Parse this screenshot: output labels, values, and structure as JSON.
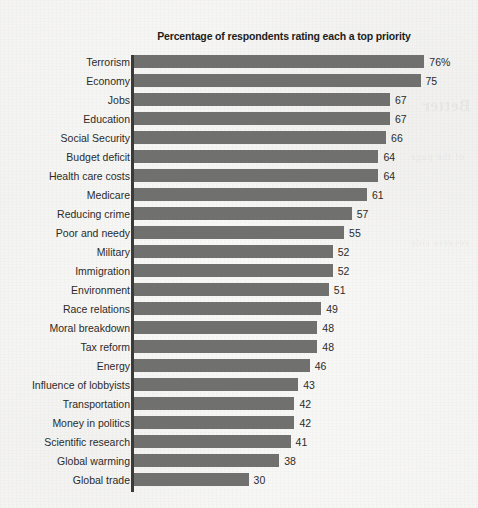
{
  "chart_data": {
    "type": "bar",
    "orientation": "horizontal",
    "title": "Percentage of respondents rating each a top priority",
    "xlabel": "",
    "ylabel": "",
    "xlim": [
      0,
      76
    ],
    "grid": false,
    "legend": false,
    "value_suffix_first": "%",
    "categories": [
      "Terrorism",
      "Economy",
      "Jobs",
      "Education",
      "Social Security",
      "Budget deficit",
      "Health care costs",
      "Medicare",
      "Reducing crime",
      "Poor and needy",
      "Military",
      "Immigration",
      "Environment",
      "Race relations",
      "Moral breakdown",
      "Tax reform",
      "Energy",
      "Influence of lobbyists",
      "Transportation",
      "Money in politics",
      "Scientific research",
      "Global warming",
      "Global trade"
    ],
    "values": [
      76,
      75,
      67,
      67,
      66,
      64,
      64,
      61,
      57,
      55,
      52,
      52,
      51,
      49,
      48,
      48,
      46,
      43,
      42,
      42,
      41,
      38,
      30
    ],
    "value_labels": [
      "76%",
      "75",
      "67",
      "67",
      "66",
      "64",
      "64",
      "61",
      "57",
      "55",
      "52",
      "52",
      "51",
      "49",
      "48",
      "48",
      "46",
      "43",
      "42",
      "42",
      "41",
      "38",
      "30"
    ],
    "colors": {
      "bar": "#70706f",
      "axis": "#3a3a38",
      "text": "#2b2b29",
      "title": "#1d1d1b",
      "background": "#fbfbfa"
    }
  },
  "page": {
    "ghost_text_a": "Better",
    "ghost_text_b": "of the page",
    "ghost_text_c": "reverse side",
    "ghost_text_d": ""
  }
}
